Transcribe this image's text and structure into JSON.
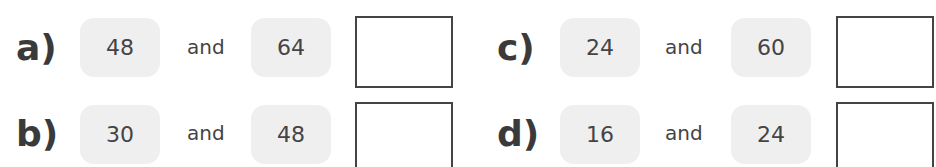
{
  "problems": [
    {
      "label": "a)",
      "first": "48",
      "connector": "and",
      "second": "64",
      "answer": ""
    },
    {
      "label": "b)",
      "first": "30",
      "connector": "and",
      "second": "48",
      "answer": ""
    },
    {
      "label": "c)",
      "first": "24",
      "connector": "and",
      "second": "60",
      "answer": ""
    },
    {
      "label": "d)",
      "first": "16",
      "connector": "and",
      "second": "24",
      "answer": ""
    }
  ]
}
